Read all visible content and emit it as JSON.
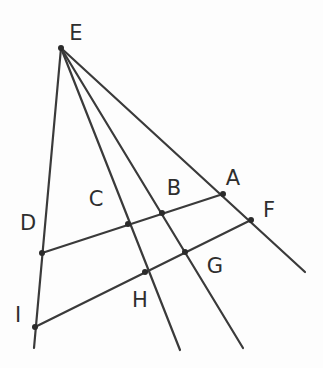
{
  "figure": {
    "kind": "geometry-diagram",
    "title": "",
    "background_color": "#fdfdfd",
    "stroke_color": "#3a3a3a",
    "label_color": "#2e2e2e",
    "point_color": "#2b2b2b",
    "stroke_width": 2.2,
    "point_radius": 3.0,
    "width": 323,
    "height": 368
  },
  "points": {
    "A": {
      "label": "A",
      "x": 223,
      "y": 194,
      "label_x": 233,
      "label_y": 178,
      "marked": true
    },
    "B": {
      "label": "B",
      "x": 162,
      "y": 213,
      "label_x": 174,
      "label_y": 188,
      "marked": true
    },
    "C": {
      "label": "C",
      "x": 128,
      "y": 224,
      "label_x": 96,
      "label_y": 199,
      "marked": true
    },
    "D": {
      "label": "D",
      "x": 42,
      "y": 253,
      "label_x": 28,
      "label_y": 223,
      "marked": true
    },
    "E": {
      "label": "E",
      "x": 61,
      "y": 48,
      "label_x": 76,
      "label_y": 33,
      "marked": true
    },
    "F": {
      "label": "F",
      "x": 251,
      "y": 220,
      "label_x": 269,
      "label_y": 210,
      "marked": true
    },
    "G": {
      "label": "G",
      "x": 185,
      "y": 252,
      "label_x": 215,
      "label_y": 266,
      "marked": true
    },
    "H": {
      "label": "H",
      "x": 145,
      "y": 272,
      "label_x": 140,
      "label_y": 300,
      "marked": true
    },
    "I": {
      "label": "I",
      "x": 35,
      "y": 327,
      "label_x": 18,
      "label_y": 315,
      "marked": true
    }
  },
  "segments": [
    {
      "name": "ray-E-to-left-bottom",
      "from": [
        61,
        48
      ],
      "to": [
        34,
        348
      ],
      "through": [
        "D",
        "I"
      ]
    },
    {
      "name": "ray-E-through-C-H",
      "from": [
        61,
        48
      ],
      "to": [
        180,
        350
      ],
      "through": [
        "C",
        "H"
      ]
    },
    {
      "name": "ray-E-through-B-G",
      "from": [
        61,
        48
      ],
      "to": [
        243,
        348
      ],
      "through": [
        "B",
        "G"
      ]
    },
    {
      "name": "ray-E-through-A-F",
      "from": [
        61,
        48
      ],
      "to": [
        305,
        272
      ],
      "through": [
        "A",
        "F"
      ]
    },
    {
      "name": "transversal-D-to-A",
      "from": [
        42,
        253
      ],
      "to": [
        223,
        194
      ],
      "through": [
        "C",
        "B"
      ]
    },
    {
      "name": "transversal-I-to-F",
      "from": [
        35,
        327
      ],
      "to": [
        251,
        220
      ],
      "through": [
        "H",
        "G"
      ]
    }
  ],
  "labels_order": [
    "E",
    "A",
    "B",
    "C",
    "D",
    "F",
    "G",
    "H",
    "I"
  ]
}
